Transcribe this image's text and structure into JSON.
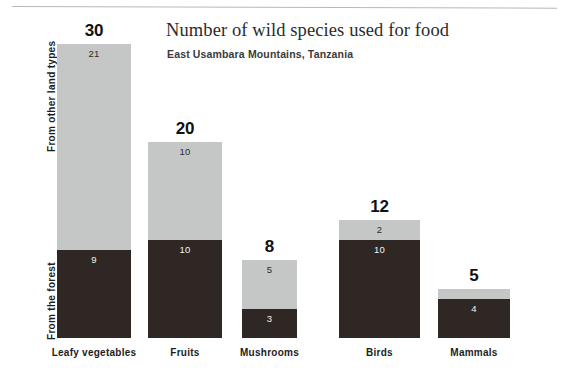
{
  "header": {
    "title": "Number of wild species used for food",
    "subtitle": "East Usambara Mountains, Tanzania"
  },
  "axis": {
    "upper_group_label": "From other land types",
    "lower_group_label": "From the forest"
  },
  "colors": {
    "other_land_types": "#c5c6c6",
    "forest": "#2e2724",
    "total_label": "#111111",
    "background": "#ffffff"
  },
  "chart_data": {
    "type": "bar",
    "stacked": true,
    "title": "Number of wild species used for food",
    "subtitle": "East Usambara Mountains, Tanzania",
    "xlabel": "",
    "ylabel": "",
    "ylim": [
      0,
      30
    ],
    "grid": false,
    "legend": "y-axis side labels",
    "categories": [
      "Leafy vegetables",
      "Fruits",
      "Mushrooms",
      "Birds",
      "Mammals"
    ],
    "series": [
      {
        "name": "From the forest",
        "color": "#2e2724",
        "values": [
          9,
          10,
          3,
          10,
          4
        ]
      },
      {
        "name": "From other land types",
        "color": "#c5c6c6",
        "values": [
          21,
          10,
          5,
          2,
          1
        ]
      }
    ],
    "totals": [
      30,
      20,
      8,
      12,
      5
    ],
    "total_labels": [
      "30",
      "20",
      "8",
      "12",
      "5"
    ]
  },
  "bars": [
    {
      "category": "Leafy vegetables",
      "total": "30",
      "forest_value": "9",
      "other_value": "21",
      "left": 57,
      "width": 74
    },
    {
      "category": "Fruits",
      "total": "20",
      "forest_value": "10",
      "other_value": "10",
      "left": 148,
      "width": 74
    },
    {
      "category": "Mushrooms",
      "total": "8",
      "forest_value": "3",
      "other_value": "5",
      "left": 242,
      "width": 55
    },
    {
      "category": "Birds",
      "total": "12",
      "forest_value": "10",
      "other_value": "2",
      "left": 339,
      "width": 81
    },
    {
      "category": "Mammals",
      "total": "5",
      "forest_value": "4",
      "other_value": "1",
      "left": 438,
      "width": 72
    }
  ]
}
